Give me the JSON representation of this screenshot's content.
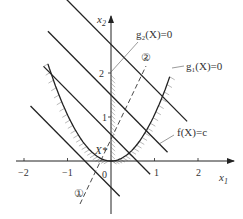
{
  "diagram": {
    "type": "optimization-constraint-plot",
    "axes": {
      "x_label": "x",
      "x_label_sub": "1",
      "y_label": "x",
      "y_label_sub": "2",
      "x_ticks": [
        "−2",
        "−1",
        "0",
        "1",
        "2"
      ],
      "x_tick_values": [
        -2,
        -1,
        0,
        1,
        2
      ],
      "y_ticks": [
        "1",
        "2"
      ],
      "y_tick_values": [
        1,
        2
      ],
      "xlim": [
        -2.1,
        2.5
      ],
      "ylim": [
        -1.1,
        3.3
      ]
    },
    "curves": {
      "g1": {
        "label": "g₁(X)=0",
        "equation": "x2 = 1.05 * x1^2",
        "x_range": [
          -1.45,
          1.35
        ]
      },
      "g2": {
        "label": "g₂(X)=0",
        "equation": "x1 = 0"
      },
      "f": {
        "label": "f(X)=c",
        "slope": -1,
        "intercepts": [
          2.65,
          1.5,
          0.6,
          -0.6
        ]
      }
    },
    "annotations": {
      "optimum": "X*",
      "path_start": "①",
      "path_end": "②"
    },
    "colors": {
      "ink": "#222222",
      "hatch": "#888888"
    }
  }
}
